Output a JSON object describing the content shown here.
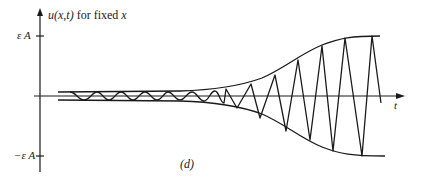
{
  "figure": {
    "panel_label": "(d)",
    "y_axis_label": "u(x,t) for fixed x",
    "x_axis_label": "t",
    "y_ticks": [
      {
        "label": "εA",
        "value": 1
      },
      {
        "label": "−εA",
        "value": -1
      }
    ],
    "colors": {
      "ink": "#1a1a1a",
      "background": "#ffffff"
    }
  },
  "labels": {
    "y_axis_u": "u",
    "y_axis_args": "(x,t)",
    "y_axis_rest": " for fixed ",
    "y_axis_x": "x",
    "tick_top": "ε A",
    "tick_bottom": "−ε A",
    "t": "t",
    "panel": "(d)"
  }
}
